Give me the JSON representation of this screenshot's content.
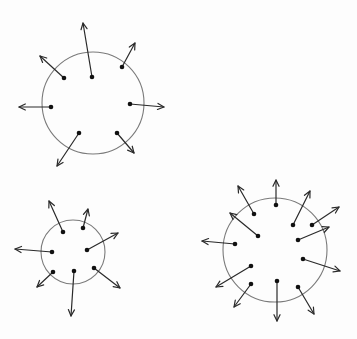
{
  "diagram": {
    "colors": {
      "stroke": "#2a2a2a",
      "circle": "#7a7a7a",
      "background": "#fdfdfd"
    },
    "figures": [
      {
        "id": "top-circle",
        "circle": {
          "cx": 93,
          "cy": 103,
          "r": 51
        },
        "arrows": [
          {
            "from": [
              92,
              77
            ],
            "to": [
              83,
              23
            ]
          },
          {
            "from": [
              122,
              67
            ],
            "to": [
              135,
              43
            ]
          },
          {
            "from": [
              64,
              78
            ],
            "to": [
              40,
              56
            ]
          },
          {
            "from": [
              51,
              107
            ],
            "to": [
              19,
              107
            ]
          },
          {
            "from": [
              130,
              104
            ],
            "to": [
              164,
              107
            ]
          },
          {
            "from": [
              79,
              133
            ],
            "to": [
              57,
              166
            ]
          },
          {
            "from": [
              117,
              133
            ],
            "to": [
              134,
              153
            ]
          }
        ]
      },
      {
        "id": "bottom-left-circle",
        "circle": {
          "cx": 73,
          "cy": 252,
          "r": 32
        },
        "arrows": [
          {
            "from": [
              63,
              232
            ],
            "to": [
              49,
              201
            ]
          },
          {
            "from": [
              83,
              228
            ],
            "to": [
              88,
              209
            ]
          },
          {
            "from": [
              87,
              250
            ],
            "to": [
              118,
              233
            ]
          },
          {
            "from": [
              52,
              252
            ],
            "to": [
              15,
              249
            ]
          },
          {
            "from": [
              53,
              272
            ],
            "to": [
              37,
              287
            ]
          },
          {
            "from": [
              74,
              271
            ],
            "to": [
              71,
              316
            ]
          },
          {
            "from": [
              94,
              268
            ],
            "to": [
              120,
              288
            ]
          }
        ]
      },
      {
        "id": "bottom-right-circle",
        "circle": {
          "cx": 275,
          "cy": 250,
          "r": 52
        },
        "arrows": [
          {
            "from": [
              276,
              205
            ],
            "to": [
              276,
              180
            ]
          },
          {
            "from": [
              254,
              214
            ],
            "to": [
              238,
              186
            ]
          },
          {
            "from": [
              293,
              225
            ],
            "to": [
              310,
              191
            ]
          },
          {
            "from": [
              312,
              225
            ],
            "to": [
              339,
              207
            ]
          },
          {
            "from": [
              258,
              236
            ],
            "to": [
              230,
              213
            ]
          },
          {
            "from": [
              298,
              240
            ],
            "to": [
              329,
              227
            ]
          },
          {
            "from": [
              235,
              244
            ],
            "to": [
              202,
              241
            ]
          },
          {
            "from": [
              303,
              259
            ],
            "to": [
              340,
              271
            ]
          },
          {
            "from": [
              251,
              266
            ],
            "to": [
              216,
              287
            ]
          },
          {
            "from": [
              251,
              284
            ],
            "to": [
              234,
              307
            ]
          },
          {
            "from": [
              277,
              281
            ],
            "to": [
              277,
              321
            ]
          },
          {
            "from": [
              298,
              287
            ],
            "to": [
              314,
              314
            ]
          }
        ]
      }
    ]
  }
}
